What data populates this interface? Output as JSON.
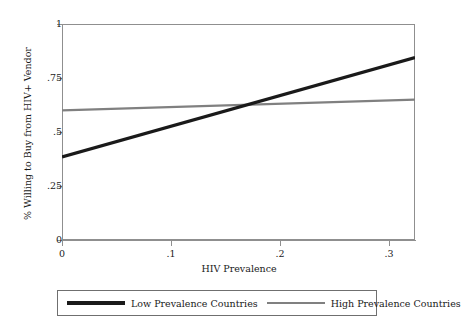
{
  "chart_data": {
    "type": "line",
    "title": "",
    "xlabel": "HIV Prevalence",
    "ylabel": "% Willing to Buy from HIV+ Vendor",
    "xlim": [
      0,
      0.324
    ],
    "ylim": [
      0,
      1
    ],
    "grid": false,
    "legend_position": "bottom",
    "xticks": [
      "0",
      ".1",
      ".2",
      ".3"
    ],
    "xtick_values": [
      0,
      0.1,
      0.2,
      0.3
    ],
    "yticks": [
      "0",
      ".25",
      ".5",
      ".75",
      "1"
    ],
    "ytick_values": [
      0,
      0.25,
      0.5,
      0.75,
      1
    ],
    "series": [
      {
        "name": "Low Prevalence Countries",
        "color": "#1a1a1a",
        "width": 3.2,
        "x": [
          0,
          0.324
        ],
        "values": [
          0.385,
          0.845
        ]
      },
      {
        "name": "High Prevalence Countries",
        "color": "#808080",
        "width": 2.4,
        "x": [
          0,
          0.324
        ],
        "values": [
          0.6,
          0.65
        ]
      }
    ],
    "annotations": [
      {
        "label": "lines cross",
        "x": 0.172,
        "y": 0.61
      }
    ]
  },
  "legend": {
    "entries": [
      {
        "label": "Low Prevalence Countries"
      },
      {
        "label": "High Prevalence Countries"
      }
    ]
  }
}
